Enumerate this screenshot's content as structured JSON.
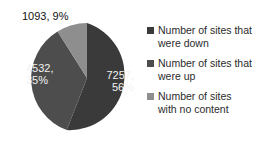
{
  "chart_data": {
    "type": "pie",
    "title": "",
    "subtitle": "",
    "xlabel": "",
    "ylabel": "",
    "legend_position": "right",
    "grid": false,
    "categories": [
      "Number of sites that were down",
      "Number of sites that were up",
      "Number of sites with no content"
    ],
    "values": [
      7257,
      4532,
      1093
    ],
    "percentages": [
      56,
      35,
      9
    ],
    "colors": [
      "#3a3a3a",
      "#4d4d4d",
      "#8e8e8e"
    ],
    "start_angle_deg": 0,
    "direction": "clockwise",
    "slices": [
      {
        "name": "Number of sites that were down",
        "value": 7257,
        "percent": 56,
        "label": "7257,\n56%",
        "color": "#3a3a3a",
        "label_placement": "inside"
      },
      {
        "name": "Number of sites that were up",
        "value": 4532,
        "percent": 35,
        "label": "4532,\n35%",
        "color": "#4d4d4d",
        "label_placement": "inside"
      },
      {
        "name": "Number of sites with no content",
        "value": 1093,
        "percent": 9,
        "label": "1093, 9%",
        "color": "#8e8e8e",
        "label_placement": "outside"
      }
    ]
  },
  "labels": {
    "down": "7257,\n56%",
    "up": "4532,\n35%",
    "no_content": "1093, 9%"
  },
  "legend": {
    "items": [
      {
        "label": "Number of sites that were down",
        "color": "#3a3a3a"
      },
      {
        "label": "Number of sites that were up",
        "color": "#4d4d4d"
      },
      {
        "label": "Number of sites with no content",
        "color": "#8e8e8e"
      }
    ]
  }
}
